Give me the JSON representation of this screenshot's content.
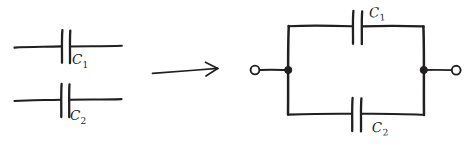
{
  "figure": {
    "kind": "hand-drawn-circuit-diagram",
    "ink_color": "#211f1f",
    "background_color": "#ffffff"
  },
  "left_side": {
    "caption": "",
    "components": [
      {
        "id": "left-capacitor-1",
        "type": "capacitor",
        "label": "C",
        "subscript": "1",
        "label_full": "C1",
        "orientation": "horizontal",
        "wire_y": 47,
        "wire_x_start": 14,
        "wire_x_end": 122,
        "plate_x_left": 62,
        "plate_x_right": 70,
        "plate_y_top": 30,
        "plate_y_bottom": 63
      },
      {
        "id": "left-capacitor-2",
        "type": "capacitor",
        "label": "C",
        "subscript": "2",
        "label_full": "C2",
        "orientation": "horizontal",
        "wire_y": 100,
        "wire_x_start": 14,
        "wire_x_end": 122,
        "plate_x_left": 61,
        "plate_x_right": 69,
        "plate_y_top": 84,
        "plate_y_bottom": 117
      }
    ]
  },
  "arrow": {
    "id": "transformation-arrow",
    "direction": "right",
    "x_start": 152,
    "x_end": 218,
    "y": 70,
    "meaning": "becomes / is equivalent to"
  },
  "right_side": {
    "caption": "",
    "circuit": {
      "id": "parallel-capacitor-circuit",
      "topology": "parallel",
      "rect_left": 288,
      "rect_right": 424,
      "rect_top": 26,
      "rect_bottom": 114,
      "terminals": [
        {
          "id": "terminal-left",
          "cx": 255,
          "cy": 70,
          "r": 4.4,
          "lead_from_x": 259,
          "lead_to_x": 288
        },
        {
          "id": "terminal-right",
          "cx": 456,
          "cy": 70,
          "r": 4.4,
          "lead_from_x": 424,
          "lead_to_x": 452
        }
      ],
      "junction_nodes": [
        {
          "id": "node-left",
          "cx": 288,
          "cy": 70,
          "r": 3.6
        },
        {
          "id": "node-right",
          "cx": 424,
          "cy": 70,
          "r": 3.6
        }
      ],
      "components": [
        {
          "id": "right-capacitor-1",
          "type": "capacitor",
          "label": "C",
          "subscript": "1",
          "label_full": "C1",
          "branch": "top",
          "wire_y": 27,
          "plate_x_left": 353,
          "plate_x_right": 362,
          "plate_y_top": 11,
          "plate_y_bottom": 44
        },
        {
          "id": "right-capacitor-2",
          "type": "capacitor",
          "label": "C",
          "subscript": "2",
          "label_full": "C2",
          "branch": "bottom",
          "wire_y": 114,
          "plate_x_left": 352,
          "plate_x_right": 361,
          "plate_y_top": 98,
          "plate_y_bottom": 131
        }
      ]
    }
  }
}
